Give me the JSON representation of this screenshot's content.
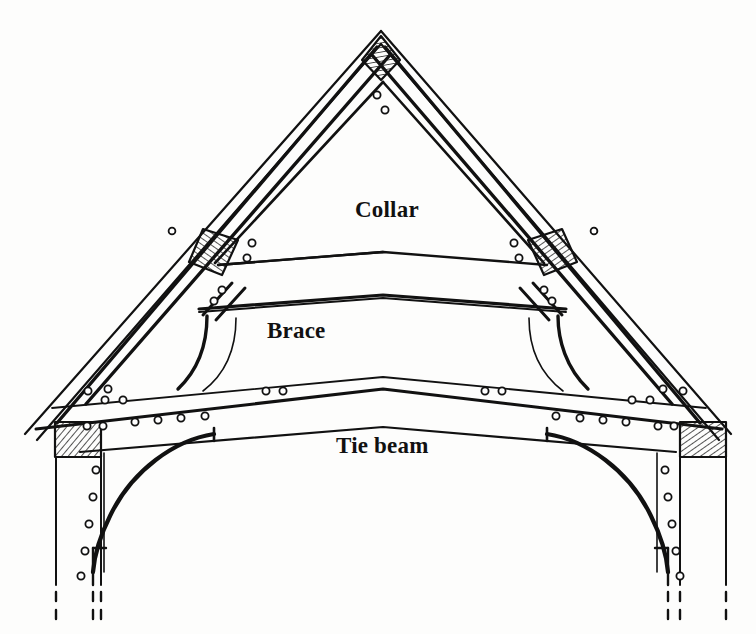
{
  "figure": {
    "type": "architectural-line-diagram",
    "background_color": "#fdfdfc",
    "ink_color": "#111111",
    "width": 756,
    "height": 634
  },
  "labels": {
    "collar": "Collar",
    "brace": "Brace",
    "tie_beam": "Tie beam"
  },
  "components": {
    "apex_joint": "hatched diamond joint block at roof apex",
    "rafter_joints": "hatched parallelogram joint blocks on principal rafters",
    "wall_plate_blocks": "hatched rectangular wall-plate blocks at eaves",
    "pegs": "small circles marking timber pegs",
    "posts": "vertical wall posts ending in dashed lines",
    "curved_braces": "arched braces below tie beam and above tie beam"
  },
  "colors": {
    "ink": "#111111",
    "hatch": "#2a2a2a",
    "paper": "#fdfdfc",
    "light_line": "#3a3a3a"
  }
}
